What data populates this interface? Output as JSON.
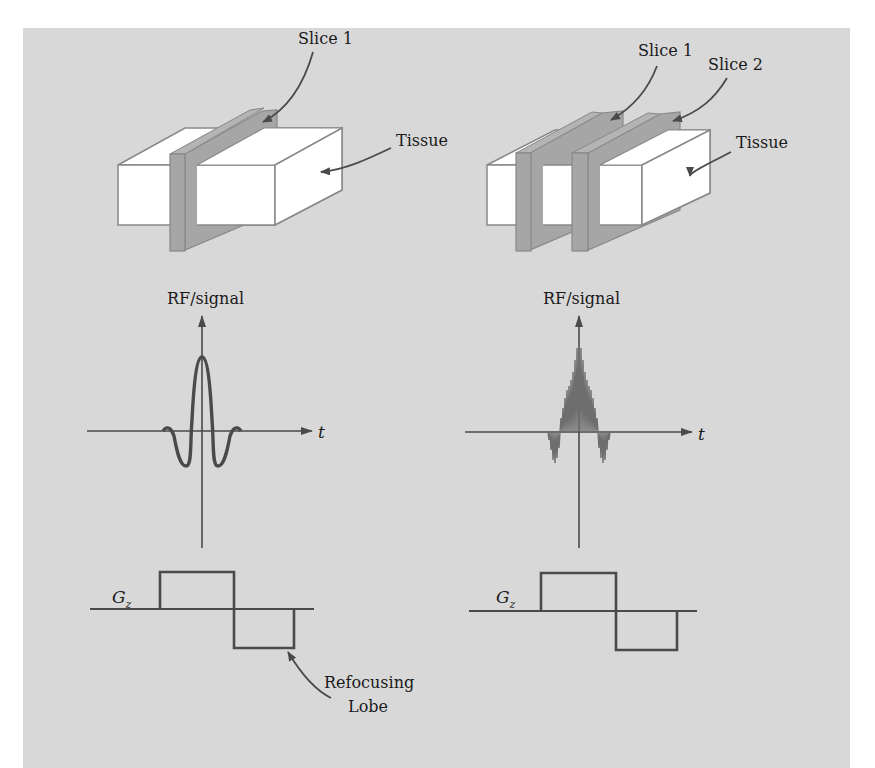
{
  "figure": {
    "background_color": "#d8d8d8",
    "slice_color": "#a6a6a6",
    "tissue_color": "#ffffff",
    "line_color": "#4a4a4a"
  },
  "left_panel": {
    "labels": {
      "slice1": "Slice 1",
      "tissue": "Tissue",
      "rf_axis": "RF/signal",
      "time_axis": "t",
      "gradient": "G",
      "gradient_subscript": "z",
      "refocusing_line1": "Refocusing",
      "refocusing_line2": "Lobe"
    },
    "rf_pulse": "single-band sinc",
    "slice_count": 1
  },
  "right_panel": {
    "labels": {
      "slice1": "Slice 1",
      "slice2": "Slice 2",
      "tissue": "Tissue",
      "rf_axis": "RF/signal",
      "time_axis": "t",
      "gradient": "G",
      "gradient_subscript": "z"
    },
    "rf_pulse": "multiband modulated sinc",
    "slice_count": 2
  }
}
